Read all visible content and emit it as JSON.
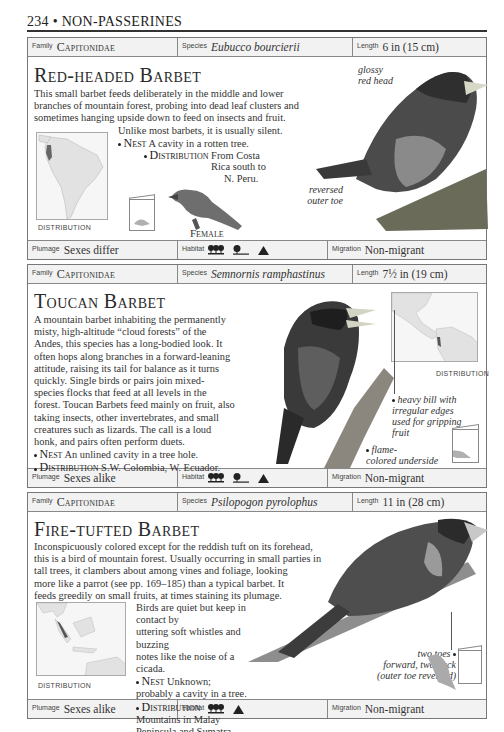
{
  "page": {
    "number": "234",
    "section": "NON-PASSERINES",
    "header": "234 • NON-PASSERINES"
  },
  "labels": {
    "family": "Family",
    "species": "Species",
    "length": "Length",
    "plumage": "Plumage",
    "habitat": "Habitat",
    "migration": "Migration",
    "distribution_caption": "DISTRIBUTION",
    "nest_kw": "Nest",
    "distribution_kw": "Distribution"
  },
  "entries": [
    {
      "family": "Capitonidae",
      "species": "Eubucco bourcierii",
      "length": "6 in (15 cm)",
      "title": "Red-headed Barbet",
      "body_lines": [
        "This small barbet feeds deliberately in the middle and lower",
        "branches of mountain forest, probing into dead leaf clusters and",
        "sometimes hanging upside down to feed on insects and fruit."
      ],
      "body_indent_line": "Unlike most barbets, it is usually silent.",
      "nest": "A cavity in a rotten tree.",
      "distribution_lines": [
        "From Costa",
        "Rica south to",
        "N. Peru."
      ],
      "annotations": {
        "head": [
          "glossy",
          "red head"
        ],
        "toe": [
          "reversed",
          "outer toe"
        ]
      },
      "female_caption": "Female",
      "plumage": "Sexes differ",
      "habitat_icons": [
        "forest-icon",
        "woodland-edge-icon",
        "mountain-icon"
      ],
      "migration": "Non-migrant"
    },
    {
      "family": "Capitonidae",
      "species": "Semnornis ramphastinus",
      "length": "7½ in (19 cm)",
      "title": "Toucan Barbet",
      "body_lines": [
        "A mountain barbet inhabiting the permanently",
        "misty, high-altitude “cloud forests” of the",
        "Andes, this species has a long-bodied look. It",
        "often hops along branches in a forward-leaning",
        "attitude, raising its tail for balance as it turns",
        "quickly. Single birds or pairs join mixed-",
        "species flocks that feed at all levels in the",
        "forest. Toucan Barbets feed mainly on fruit, also",
        "taking insects, other invertebrates, and small",
        "creatures such as lizards. The call is a loud",
        "honk, and pairs often perform duets."
      ],
      "nest": "An unlined cavity in a tree hole.",
      "distribution": "S.W. Colombia, W. Ecuador.",
      "annotations": {
        "bill": [
          "heavy bill with",
          "irregular edges",
          "used for gripping",
          "fruit"
        ],
        "underside": [
          "flame-",
          "colored underside"
        ]
      },
      "plumage": "Sexes alike",
      "habitat_icons": [
        "forest-icon",
        "woodland-edge-icon",
        "mountain-icon"
      ],
      "migration": "Non-migrant"
    },
    {
      "family": "Capitonidae",
      "species": "Psilopogon pyrolophus",
      "length": "11 in (28 cm)",
      "title": "Fire-tufted Barbet",
      "body_lines": [
        "Inconspicuously colored except for the reddish tuft on its forehead,",
        "this is a bird of mountain forest. Usually occurring in small parties in",
        "tall trees, it clambers about among vines and foliage, looking",
        "more like a parrot (see pp. 169–185) than a typical barbet. It",
        "feeds greedily on small fruits, at times staining its plumage."
      ],
      "body_indent_lines": [
        "Birds are quiet but keep in contact by",
        "uttering soft whistles and buzzing",
        "notes like the noise of a cicada."
      ],
      "nest_lines": [
        "Unknown;",
        "probably a cavity in a tree."
      ],
      "distribution_lines": [
        "Mountains in Malay",
        "Peninsula and Sumatra."
      ],
      "annotations": {
        "toes": [
          "two toes",
          "forward, two back",
          "(outer toe reversed)"
        ]
      },
      "plumage": "Sexes alike",
      "habitat_icons": [
        "forest-icon",
        "mountain-icon"
      ],
      "migration": "Non-migrant"
    }
  ],
  "colors": {
    "bar_bg": "#f2f2f2",
    "border": "#777777",
    "text": "#2a2a2a",
    "map_land": "#e2e2e2",
    "range_mark": "#555555"
  }
}
